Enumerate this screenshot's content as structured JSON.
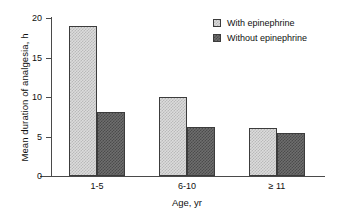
{
  "chart_data": {
    "type": "bar",
    "title": "",
    "xlabel": "Age, yr",
    "ylabel": "Mean duration of analgesia, h",
    "categories": [
      "1-5",
      "6-10",
      "≥ 11"
    ],
    "series": [
      {
        "name": "With epinephrine",
        "values": [
          19,
          10,
          6.1
        ],
        "color": "#dcdcdc"
      },
      {
        "name": "Without epinephrine",
        "values": [
          8.1,
          6.2,
          5.4
        ],
        "color": "#6e6e6e"
      }
    ],
    "ylim": [
      0,
      20
    ],
    "yticks": [
      0,
      5,
      10,
      15,
      20
    ],
    "ytick_labels": [
      "0",
      "5",
      "10",
      "15",
      "20"
    ],
    "grid": false,
    "legend_position": "top-right"
  },
  "legend": {
    "entries": [
      {
        "label": "With epinephrine",
        "swatch": "light-checker-swatch"
      },
      {
        "label": "Without epinephrine",
        "swatch": "dark-checker-swatch"
      }
    ]
  }
}
